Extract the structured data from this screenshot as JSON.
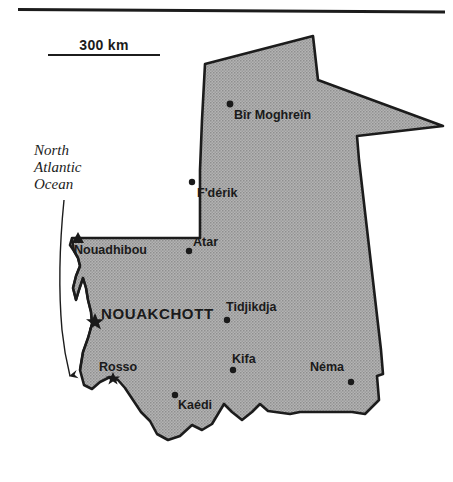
{
  "figure": {
    "kind": "map",
    "background_color": "#ffffff",
    "land_fill_color": "#a9a9a9",
    "border_color": "#1c1c1c",
    "text_color": "#1a1a1a"
  },
  "top_rule": {
    "name": "horizontal-rule"
  },
  "scale": {
    "label": "300 km",
    "bar_name": "scale-bar"
  },
  "ocean": {
    "label": "North\nAtlantic\nOcean",
    "arrow_name": "ocean-direction-arrow"
  },
  "cities": [
    {
      "name": "Bîr Moghreïn",
      "marker": "dot",
      "marker_x": 230,
      "marker_y": 104,
      "label_x": 234,
      "label_y": 108,
      "size": "sz-normal"
    },
    {
      "name": "F'dérik",
      "marker": "dot",
      "marker_x": 192,
      "marker_y": 182,
      "label_x": 197,
      "label_y": 186,
      "size": "sz-normal"
    },
    {
      "name": "Atar",
      "marker": "dot",
      "marker_x": 189,
      "marker_y": 251,
      "label_x": 193,
      "label_y": 235,
      "size": "sz-normal"
    },
    {
      "name": "Nouadhibou",
      "marker": "triangle",
      "marker_x": 78,
      "marker_y": 240,
      "label_x": 74,
      "label_y": 243,
      "size": "sz-normal"
    },
    {
      "name": "NOUAKCHOTT",
      "marker": "star",
      "marker_x": 95,
      "marker_y": 321,
      "label_x": 101,
      "label_y": 305,
      "size": "sz-capital"
    },
    {
      "name": "Tidjikdja",
      "marker": "dot",
      "marker_x": 227,
      "marker_y": 320,
      "label_x": 226,
      "label_y": 300,
      "size": "sz-normal"
    },
    {
      "name": "Kifa",
      "marker": "dot",
      "marker_x": 233,
      "marker_y": 370,
      "label_x": 232,
      "label_y": 352,
      "size": "sz-normal"
    },
    {
      "name": "Néma",
      "marker": "dot",
      "marker_x": 351,
      "marker_y": 382,
      "label_x": 310,
      "label_y": 360,
      "size": "sz-normal"
    },
    {
      "name": "Rosso",
      "marker": "star",
      "marker_x": 113,
      "marker_y": 378,
      "label_x": 99,
      "label_y": 360,
      "size": "sz-normal"
    },
    {
      "name": "Kaédi",
      "marker": "dot",
      "marker_x": 175,
      "marker_y": 395,
      "label_x": 178,
      "label_y": 398,
      "size": "sz-normal"
    }
  ]
}
